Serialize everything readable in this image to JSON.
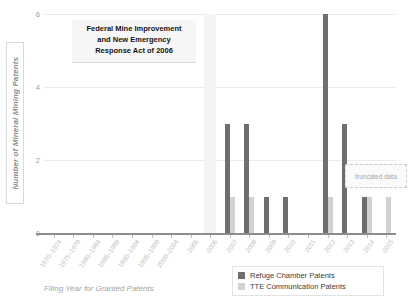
{
  "chart_data": {
    "type": "bar",
    "title": "Federal Mine Improvement and New Emergency Response Act of 2006",
    "title_lines": [
      "Federal Mine Improvement",
      "and New Emergency",
      "Response Act of 2006"
    ],
    "xlabel": "Filing Year for Granted Patents",
    "ylabel": "Number of Mineral Mining Patents",
    "ylim": [
      0,
      6
    ],
    "yticks": [
      0,
      2,
      4,
      6
    ],
    "grid": true,
    "legend_position": "bottom-right",
    "categories": [
      "1970–1974",
      "1975–1979",
      "1980–1984",
      "1985–1989",
      "1990–1994",
      "1995–1999",
      "2000–2004",
      "2005",
      "2006",
      "2007",
      "2008",
      "2009",
      "2010",
      "2011",
      "2012",
      "2013",
      "2014",
      "2015"
    ],
    "series": [
      {
        "name": "Refuge Chamber Patents",
        "color": "#6e6e6e",
        "values": [
          0,
          0,
          0,
          0,
          0,
          0,
          0,
          0,
          0,
          3,
          3,
          1,
          1,
          0,
          6,
          3,
          1,
          0
        ]
      },
      {
        "name": "TTE Communication Patents",
        "color": "#d2d2d2",
        "values": [
          0,
          0,
          0,
          0,
          0,
          0,
          0,
          0,
          0,
          1,
          1,
          0,
          0,
          0,
          1,
          0,
          1,
          1
        ]
      }
    ],
    "annotations": [
      {
        "text": "truncated data",
        "category": "2015"
      }
    ],
    "event_marker": {
      "category": "2006",
      "label": "Federal Mine Improvement and New Emergency Response Act of 2006"
    }
  },
  "legend": {
    "items": [
      {
        "label": "Refuge Chamber Patents",
        "color": "#6e6e6e"
      },
      {
        "label": "TTE Communication Patents",
        "color": "#d2d2d2"
      }
    ]
  }
}
